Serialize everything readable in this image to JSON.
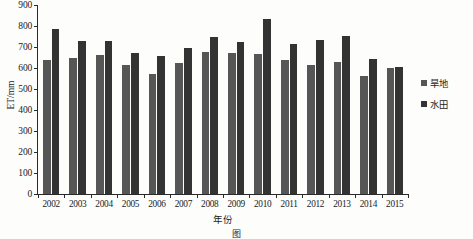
{
  "chart_data": {
    "type": "bar",
    "title": "",
    "xlabel": "年份",
    "ylabel": "ET/mm",
    "ylim": [
      0,
      900
    ],
    "ytick_step": 100,
    "yticks": [
      0,
      100,
      200,
      300,
      400,
      500,
      600,
      700,
      800,
      900
    ],
    "grid": false,
    "legend_position": "right",
    "categories": [
      "2002",
      "2003",
      "2004",
      "2005",
      "2006",
      "2007",
      "2008",
      "2009",
      "2010",
      "2011",
      "2012",
      "2013",
      "2014",
      "2015"
    ],
    "series": [
      {
        "name": "旱地",
        "color": "#565656",
        "values": [
          638,
          648,
          660,
          612,
          573,
          622,
          676,
          670,
          665,
          640,
          613,
          627,
          560,
          600
        ]
      },
      {
        "name": "水田",
        "color": "#333333",
        "values": [
          787,
          730,
          728,
          672,
          655,
          693,
          748,
          723,
          832,
          712,
          733,
          752,
          645,
          607
        ]
      }
    ]
  },
  "axis": {
    "y_title": "ET/mm",
    "x_title": "年份"
  },
  "legend": {
    "items": [
      {
        "label": "旱地"
      },
      {
        "label": "水田"
      }
    ]
  },
  "caption": {
    "text": "图"
  }
}
